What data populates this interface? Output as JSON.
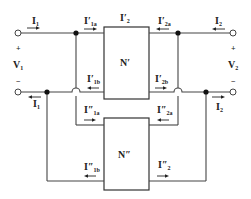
{
  "diagram": {
    "type": "two-port network parallel connection",
    "colors": {
      "wire": "#444444",
      "text": "#222222",
      "background": "#ffffff"
    },
    "blocks": {
      "upper": {
        "label": "N′"
      },
      "lower": {
        "label": "N″"
      }
    },
    "ports": {
      "port1": {
        "voltage": "V",
        "voltage_sub": "1",
        "plus": "+",
        "minus": "−"
      },
      "port2": {
        "voltage": "V",
        "voltage_sub": "2",
        "plus": "+",
        "minus": "−"
      }
    },
    "currents": {
      "I1_top": {
        "main": "I",
        "sub": "1",
        "direction": "right"
      },
      "I1_bottom": {
        "main": "I",
        "sub": "1",
        "direction": "left"
      },
      "I2_top": {
        "main": "I",
        "sub": "2",
        "direction": "left"
      },
      "I2_bottom": {
        "main": "I",
        "sub": "2",
        "direction": "right"
      },
      "I1a_prime": {
        "main": "I′",
        "sub": "1a",
        "direction": "right"
      },
      "I1b_prime": {
        "main": "I′",
        "sub": "1b",
        "direction": "left"
      },
      "I2_prime": {
        "main": "I′",
        "sub": "2"
      },
      "I2a_prime": {
        "main": "I′",
        "sub": "2a",
        "direction": "left"
      },
      "I2b_prime": {
        "main": "I′",
        "sub": "2b",
        "direction": "right"
      },
      "I1a_dprime": {
        "main": "I″",
        "sub": "1a",
        "direction": "right"
      },
      "I1b_dprime": {
        "main": "I″",
        "sub": "1b",
        "direction": "left"
      },
      "I2a_dprime": {
        "main": "I″",
        "sub": "2a",
        "direction": "left"
      },
      "I2_dprime": {
        "main": "I″",
        "sub": "2",
        "direction": "right"
      }
    }
  }
}
